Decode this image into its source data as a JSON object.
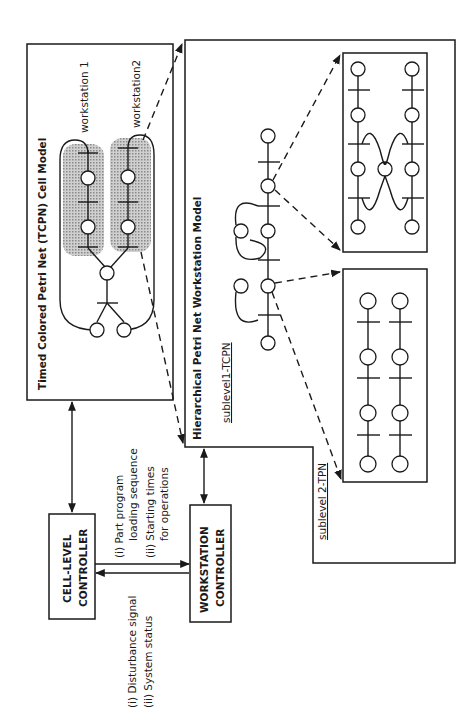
{
  "diagram": {
    "orientation": "rotated-90-ccw",
    "cell_model": {
      "title": "Timed Colored Petri Net (TCPN) Cell Model",
      "workstation_labels": [
        "workstation 1",
        "workstation2"
      ]
    },
    "workstation_model": {
      "title": "Hierarchical Petri Net Workstation Model",
      "sublevel1_label": "sublevel1-TCPN",
      "sublevel2_label": "sublevel 2-TPN"
    },
    "controllers": {
      "cell_level": {
        "line1": "CELL-LEVEL",
        "line2": "CONTROLLER"
      },
      "workstation": {
        "line1": "WORKSTATION",
        "line2": "CONTROLLER"
      }
    },
    "signals": {
      "downward": {
        "line1": "(i)  Part program",
        "line2": "loading sequence",
        "line3": "(ii) Starting times",
        "line4": "for operations"
      },
      "upward": {
        "line1": "(i)  Disturbance signal",
        "line2": "(ii) System status"
      }
    },
    "colors": {
      "ink": "#1a1a1a",
      "shade": "#b8b8b8",
      "background": "#ffffff"
    }
  }
}
